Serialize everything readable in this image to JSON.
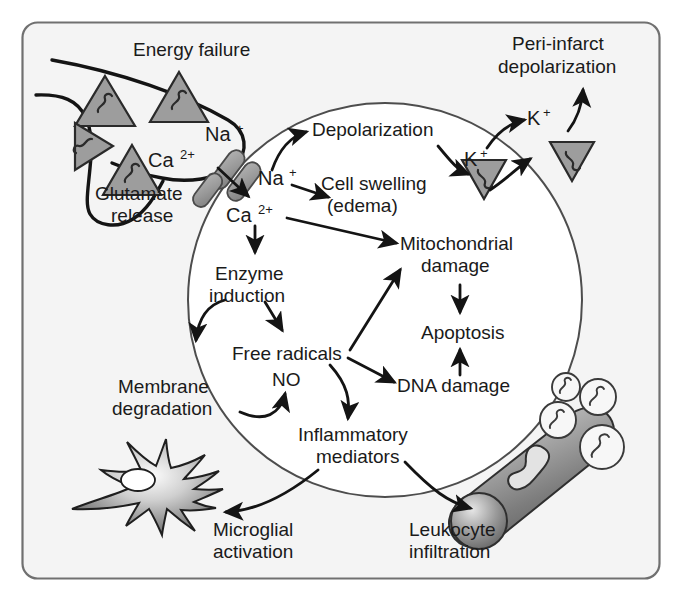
{
  "figure": {
    "frame": {
      "border_color": "#6b6b6b",
      "fill": "#f4f4f4",
      "radius": 14
    },
    "cell": {
      "name": "neuron-cell-body",
      "fill": "#ffffff",
      "stroke": "#4d4d4d"
    },
    "colors": {
      "ink": "#1a1a1a",
      "vesicle_fill": "#9d9d9d",
      "vesicle_stroke": "#2b2b2b",
      "channel_fill": "#9a9a9a",
      "vessel_light": "#efefef",
      "vessel_dark": "#6e6e6e",
      "background": "#f4f4f4"
    }
  },
  "labels": {
    "energy_failure": "Energy failure",
    "glutamate_release_l1": "Glutamate",
    "glutamate_release_l2": "release",
    "na_outside": "Na",
    "na_outside_sup": "+",
    "ca_outside": "Ca",
    "ca_outside_sup": "2+",
    "na_inside": "Na",
    "na_inside_sup": "+",
    "ca_inside": "Ca",
    "ca_inside_sup": "2+",
    "depolarization": "Depolarization",
    "cell_swelling": "Cell swelling",
    "edema": "(edema)",
    "k_inside": "K",
    "k_inside_sup": "+",
    "k_outside": "K",
    "k_outside_sup": "+",
    "peri_infarct_l1": "Peri-infarct",
    "peri_infarct_l2": "depolarization",
    "enzyme_l1": "Enzyme",
    "enzyme_l2": "induction",
    "free_radicals": "Free radicals",
    "no": "NO",
    "membrane_l1": "Membrane",
    "membrane_l2": "degradation",
    "mitochondrial_l1": "Mitochondrial",
    "mitochondrial_l2": "damage",
    "apoptosis": "Apoptosis",
    "dna_damage": "DNA damage",
    "inflammatory_l1": "Inflammatory",
    "inflammatory_l2": "mediators",
    "microglial_l1": "Microglial",
    "microglial_l2": "activation",
    "leukocyte_l1": "Leukocyte",
    "leukocyte_l2": "infiltration"
  },
  "icon_names": [
    "glutamate-vesicle-triangle-icon",
    "ion-channel-icon",
    "microglia-cell-icon",
    "blood-vessel-icon",
    "leukocyte-circle-icon",
    "arrow-icon"
  ]
}
